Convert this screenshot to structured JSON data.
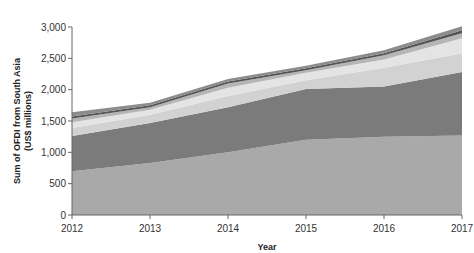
{
  "chart_data": {
    "type": "area",
    "stacked": true,
    "title": "",
    "xlabel": "Year",
    "ylabel": "Sum of OFDI from South Asia",
    "ylabel_line2": "(US$ millions)",
    "x": [
      2012,
      2013,
      2014,
      2015,
      2016,
      2017
    ],
    "ylim": [
      0,
      3000
    ],
    "yticks": [
      0,
      500,
      1000,
      1500,
      2000,
      2500,
      3000
    ],
    "ytick_labels": [
      "0",
      "500",
      "1,000",
      "1,500",
      "2,000",
      "2,500",
      "3,000"
    ],
    "xtick_labels": [
      "2012",
      "2013",
      "2014",
      "2015",
      "2016",
      "2017"
    ],
    "grid": false,
    "legend": null,
    "series": [
      {
        "name": "Layer 1",
        "color": "#a9a9a9",
        "values": [
          700,
          830,
          1000,
          1200,
          1250,
          1270
        ]
      },
      {
        "name": "Layer 2",
        "color": "#7b7b7b",
        "values": [
          560,
          640,
          720,
          810,
          800,
          1010
        ]
      },
      {
        "name": "Layer 3",
        "color": "#d2d2d2",
        "values": [
          130,
          130,
          180,
          140,
          300,
          300
        ]
      },
      {
        "name": "Layer 4",
        "color": "#e4e4e4",
        "values": [
          90,
          80,
          130,
          120,
          130,
          240
        ]
      },
      {
        "name": "Layer 5",
        "color": "#b5b5b5",
        "values": [
          60,
          40,
          70,
          40,
          70,
          80
        ]
      },
      {
        "name": "Layer 6",
        "color": "#555555",
        "values": [
          30,
          30,
          30,
          30,
          30,
          50
        ]
      },
      {
        "name": "Layer 7",
        "color": "#8c8c8c",
        "values": [
          70,
          40,
          40,
          40,
          50,
          60
        ]
      }
    ]
  }
}
